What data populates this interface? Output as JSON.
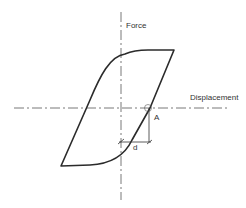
{
  "diagram": {
    "type": "hysteresis-loop",
    "axes": {
      "vertical_label": "Force",
      "horizontal_label": "Displacement"
    },
    "annotations": {
      "point_label": "A",
      "dimension_label": "d"
    },
    "colors": {
      "curve": "#2b2b2b",
      "axis": "#555555",
      "annotation": "#333333",
      "background": "#ffffff"
    }
  }
}
